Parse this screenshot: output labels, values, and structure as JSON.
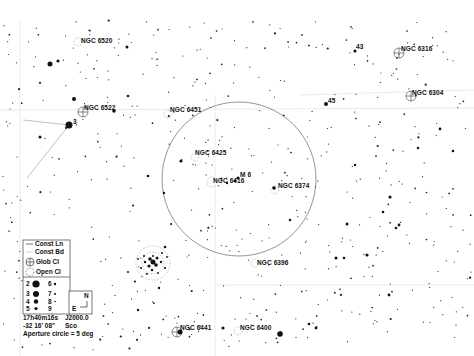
{
  "chart_data": {
    "type": "scatter",
    "center": {
      "ra": "17h40m16s",
      "dec": "-32 16' 08\"",
      "epoch": "J2000.0",
      "constellation": "Sco"
    },
    "aperture_circle": {
      "label": "Aperture circle = 5 deg",
      "cx": 239,
      "cy": 179,
      "r": 77
    },
    "objects": [
      {
        "name": "NGC 6520",
        "type": "open",
        "x": 78,
        "y": 42,
        "lx": 81,
        "ly": 37
      },
      {
        "name": "NGC 6522",
        "type": "globular",
        "x": 83,
        "y": 112,
        "lx": 84,
        "ly": 104
      },
      {
        "name": "NGC 6451",
        "type": "open",
        "x": 168,
        "y": 114,
        "lx": 170,
        "ly": 106
      },
      {
        "name": "NGC 6425",
        "type": "open",
        "x": 195,
        "y": 157,
        "lx": 195,
        "ly": 149
      },
      {
        "name": "NGC 6416",
        "type": "open",
        "x": 210,
        "y": 182,
        "lx": 213,
        "ly": 177
      },
      {
        "name": "M 6",
        "type": "open",
        "x": 236,
        "y": 179,
        "lx": 239,
        "ly": 171
      },
      {
        "name": "NGC 6374",
        "type": "open",
        "x": 275,
        "y": 189,
        "lx": 278,
        "ly": 182
      },
      {
        "name": "NGC 6396",
        "type": "open",
        "x": 255,
        "y": 262,
        "lx": 256,
        "ly": 259
      },
      {
        "name": "NGC 6441",
        "type": "globular",
        "x": 177,
        "y": 332,
        "lx": 180,
        "ly": 324
      },
      {
        "name": "NGC 6400",
        "type": "open",
        "x": 238,
        "y": 331,
        "lx": 240,
        "ly": 324
      },
      {
        "name": "NGC 6316",
        "type": "globular",
        "x": 399,
        "y": 53,
        "lx": 401,
        "ly": 45
      },
      {
        "name": "NGC 6304",
        "type": "globular",
        "x": 411,
        "y": 96,
        "lx": 412,
        "ly": 89
      },
      {
        "name": "M 7",
        "type": "open",
        "x": 153,
        "y": 263,
        "lx": null,
        "ly": null
      }
    ],
    "star_labels": [
      {
        "text": "43",
        "x": 356,
        "y": 47
      },
      {
        "text": "45",
        "x": 327,
        "y": 101
      },
      {
        "text": "3",
        "x": 73,
        "y": 122
      }
    ],
    "constellation_lines": [
      {
        "x1": 69,
        "y1": 125,
        "x2": 23,
        "y2": 120
      },
      {
        "x1": 69,
        "y1": 125,
        "x2": 27,
        "y2": 178
      }
    ]
  },
  "labels": {
    "ngc6520": "NGC 6520",
    "ngc6522": "NGC 6522",
    "ngc6451": "NGC 6451",
    "ngc6425": "NGC 6425",
    "ngc6416": "NGC 6416",
    "m6": "M 6",
    "ngc6374": "NGC 6374",
    "ngc6396": "NGC 6396",
    "ngc6441": "NGC 6441",
    "ngc6400": "NGC 6400",
    "ngc6316": "NGC 6316",
    "ngc6304": "NGC 6304",
    "star43": "43",
    "star45": "45",
    "star3": "3"
  },
  "legend": {
    "const_ln": "Const Ln",
    "const_bd": "Const Bd",
    "glob_cl": "Glob Cl",
    "open_cl": "Open Cl",
    "magnitudes": [
      "2",
      "3",
      "4",
      "5",
      "6",
      "7",
      "8",
      "9"
    ]
  },
  "compass": {
    "north": "N",
    "east": "E"
  },
  "info": {
    "ra": "17h40m16s",
    "epoch": "J2000.0",
    "dec": "-32 16' 08\"",
    "constellation": "Sco",
    "aperture": "Aperture circle = 5 deg"
  }
}
